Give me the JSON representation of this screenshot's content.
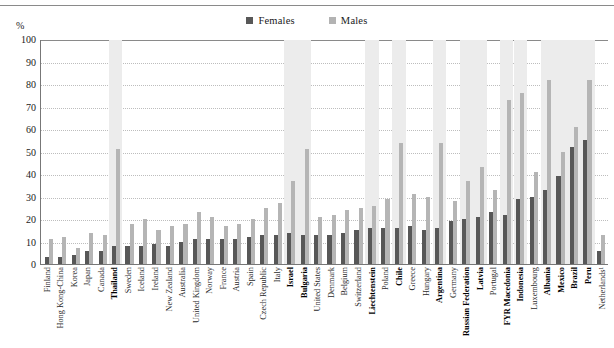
{
  "chart_data": {
    "type": "bar",
    "title": "",
    "subtitle": "",
    "xlabel": "",
    "ylabel": "%",
    "ylim": [
      0,
      100
    ],
    "ytick_labels": [
      "100",
      "90",
      "80",
      "70",
      "60",
      "50",
      "40",
      "30",
      "20",
      "10",
      "0"
    ],
    "ytick_values": [
      100,
      90,
      80,
      70,
      60,
      50,
      40,
      30,
      20,
      10,
      0
    ],
    "grid": true,
    "legend_position": "top-center",
    "legend": [
      "Females",
      "Males"
    ],
    "colors": {
      "females": "#575757",
      "males": "#b5b5b5",
      "gridline": "#bdbdbd",
      "axis": "#777777",
      "highlight_band": "#ececec"
    },
    "categories": [
      "Finland",
      "Hong Kong-China",
      "Korea",
      "Japan",
      "Canada",
      "Thailand",
      "Sweden",
      "Iceland",
      "Ireland",
      "New Zealand",
      "Australia",
      "United Kingdom",
      "Norway",
      "France",
      "Austria",
      "Spain",
      "Czech Republic",
      "Italy",
      "Israel",
      "Bulgaria",
      "United States",
      "Denmark",
      "Belgium",
      "Switzerland",
      "Liechtenstein",
      "Poland",
      "Chile",
      "Greece",
      "Hungary",
      "Argentina",
      "Germany",
      "Russian Federation",
      "Latvia",
      "Portugal",
      "FYR Macedonia",
      "Indonesia",
      "Luxembourg",
      "Albania",
      "Mexico",
      "Brazil",
      "Peru",
      "Netherlands¹"
    ],
    "emphasized_categories": [
      "Thailand",
      "Israel",
      "Bulgaria",
      "Liechtenstein",
      "Chile",
      "Argentina",
      "Russian Federation",
      "Latvia",
      "FYR Macedonia",
      "Indonesia",
      "Albania",
      "Mexico",
      "Brazil",
      "Peru"
    ],
    "series": [
      {
        "name": "Females",
        "values": [
          3,
          3,
          4,
          6,
          6,
          8,
          8,
          8,
          9,
          8,
          10,
          11,
          11,
          11,
          11,
          12,
          13,
          13,
          14,
          13,
          13,
          13,
          14,
          15,
          16,
          16,
          16,
          17,
          15,
          16,
          19,
          20,
          21,
          23,
          22,
          29,
          30,
          33,
          39,
          52,
          55,
          6
        ]
      },
      {
        "name": "Males",
        "values": [
          11,
          12,
          7,
          14,
          13,
          51,
          18,
          20,
          15,
          17,
          18,
          23,
          21,
          17,
          18,
          20,
          25,
          27,
          37,
          51,
          21,
          22,
          24,
          25,
          26,
          29,
          54,
          31,
          30,
          54,
          28,
          37,
          43,
          33,
          73,
          76,
          41,
          82,
          50,
          61,
          82,
          13
        ]
      }
    ]
  }
}
